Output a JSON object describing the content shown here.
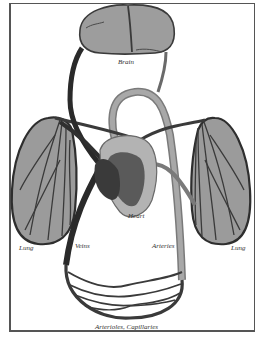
{
  "diagram": {
    "labels": {
      "brain": "Brain",
      "heart": "Heart",
      "lung_left": "Lung",
      "lung_right": "Lung",
      "veins": "Veins",
      "arteries": "Arteries",
      "capillaries": "Arterioles, Capillaries"
    },
    "nodes": [
      "Brain",
      "Heart",
      "Lung",
      "Lung",
      "Arterioles, Capillaries"
    ],
    "edges": [
      {
        "from": "Heart",
        "to": "Brain",
        "via": "Arteries"
      },
      {
        "from": "Brain",
        "to": "Heart",
        "via": "Veins"
      },
      {
        "from": "Heart",
        "to": "Lung",
        "side": "left"
      },
      {
        "from": "Heart",
        "to": "Lung",
        "side": "right"
      },
      {
        "from": "Heart",
        "to": "Arterioles, Capillaries",
        "via": "Arteries"
      },
      {
        "from": "Arterioles, Capillaries",
        "to": "Heart",
        "via": "Veins"
      }
    ],
    "colors": {
      "organ_fill": "#9a9a9a",
      "organ_light": "#b5b5b5",
      "vessel_dark": "#2e2e2e",
      "vessel_mid": "#6d6d6d",
      "frame": "#555555"
    }
  }
}
